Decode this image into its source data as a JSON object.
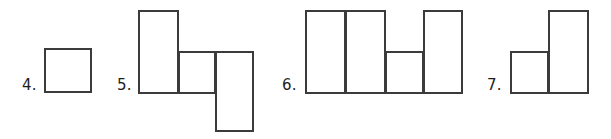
{
  "page": {
    "background_color": "#ffffff",
    "stroke_color": "#3b3b3b",
    "label_color": "#1e1e1e",
    "width": 611,
    "height": 139
  },
  "figures": [
    {
      "label": "4.",
      "name": "figure-4",
      "shape_count": 1,
      "description": "single square",
      "shapes": [
        {
          "name": "square",
          "x": 44,
          "y": 48,
          "width": 48,
          "height": 45
        }
      ]
    },
    {
      "label": "5.",
      "name": "figure-5",
      "shape_count": 3,
      "description": "tall rectangle, small square, tall rectangle offset downward",
      "shapes": [
        {
          "name": "tall-rectangle-left",
          "x": 138,
          "y": 10,
          "width": 41,
          "height": 84
        },
        {
          "name": "square-middle",
          "x": 178,
          "y": 51,
          "width": 38,
          "height": 43
        },
        {
          "name": "tall-rectangle-right",
          "x": 215,
          "y": 51,
          "width": 39,
          "height": 81
        }
      ]
    },
    {
      "label": "6.",
      "name": "figure-6",
      "shape_count": 4,
      "description": "two tall rectangles, a small square, and a tall rectangle",
      "shapes": [
        {
          "name": "tall-rectangle-1",
          "x": 305,
          "y": 10,
          "width": 41,
          "height": 84
        },
        {
          "name": "tall-rectangle-2",
          "x": 345,
          "y": 10,
          "width": 41,
          "height": 84
        },
        {
          "name": "square-3",
          "x": 385,
          "y": 51,
          "width": 39,
          "height": 43
        },
        {
          "name": "tall-rectangle-4",
          "x": 423,
          "y": 10,
          "width": 40,
          "height": 84
        }
      ]
    },
    {
      "label": "7.",
      "name": "figure-7",
      "shape_count": 2,
      "description": "small square next to a tall rectangle",
      "shapes": [
        {
          "name": "square-left",
          "x": 510,
          "y": 51,
          "width": 39,
          "height": 43
        },
        {
          "name": "tall-rectangle-right",
          "x": 548,
          "y": 10,
          "width": 41,
          "height": 84
        }
      ]
    }
  ]
}
